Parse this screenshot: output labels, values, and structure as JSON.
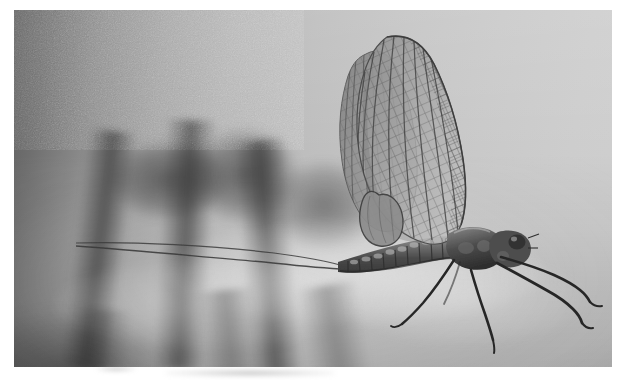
{
  "image": {
    "kind": "photograph",
    "medium": "black-and-white film print",
    "title": "Mayfly resting on a human hand",
    "caption": "",
    "orientation": "landscape",
    "width_px": 627,
    "height_px": 380
  },
  "print": {
    "border_color": "#ffffff",
    "left_px": 14,
    "top_px": 10,
    "width_px": 598,
    "height_px": 357
  },
  "palette": {
    "background_dark": "#5d5d5d",
    "background_mid": "#a2a2a2",
    "background_light": "#cfcfcf",
    "skin_highlight": "#dcdcdc",
    "crease_shadow": "#3a3a3a",
    "insect_body": "#4a4a4a",
    "insect_dark": "#2b2b2b",
    "wing_membrane": "#9a9a9a",
    "wing_vein": "#5a5a5a",
    "paper_white": "#ffffff"
  },
  "subject": {
    "common_name": "mayfly",
    "pose": "perched, wings held upright together",
    "parts": [
      {
        "name": "forewing",
        "count": 2,
        "note": "large triangular wings held vertically, dense cross-vein lattice"
      },
      {
        "name": "hindwing",
        "count": 2,
        "note": "small rounded lobe at forewing base"
      },
      {
        "name": "thorax",
        "note": "stout, darker than abdomen"
      },
      {
        "name": "abdomen",
        "count_segments": 10,
        "note": "tapering, banded segments"
      },
      {
        "name": "cerci",
        "count": 2,
        "note": "two long thread-like tail filaments extending left"
      },
      {
        "name": "foreleg",
        "count": 2,
        "note": "long, held forward past the head"
      },
      {
        "name": "midleg",
        "count": 2
      },
      {
        "name": "hindleg",
        "count": 2
      },
      {
        "name": "compound-eye",
        "count": 2
      },
      {
        "name": "antenna",
        "count": 2,
        "note": "very short"
      }
    ]
  },
  "hand": {
    "description": "out-of-focus human hand, fingers horizontal, insect perched on the index finger",
    "visible_fingers": 4,
    "creases": 3
  }
}
